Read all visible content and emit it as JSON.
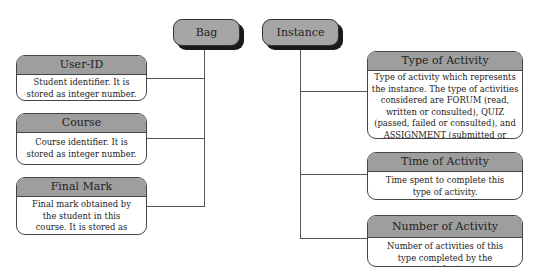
{
  "diagram": {
    "roots": {
      "bag": {
        "label": "Bag",
        "fill": "#a6a6a6"
      },
      "instance": {
        "label": "Instance",
        "fill": "#a6a6a6"
      }
    },
    "bag_attributes": [
      {
        "title": "User-ID",
        "description": "Student identifier. It is stored as integer number."
      },
      {
        "title": "Course",
        "description": "Course identifier. It is stored as integer number."
      },
      {
        "title": "Final Mark",
        "description": "Final mark obtained by the student in this course. It is stored as numerically."
      }
    ],
    "instance_attributes": [
      {
        "title": "Type of Activity",
        "description": "Type of activity which represents the instance. The type of activities considered are FORUM (read, written or consulted), QUIZ (passed, failed or consulted), and ASSIGNMENT (submitted or consulted)."
      },
      {
        "title": "Time of Activity",
        "description": "Time spent to complete this type of activity."
      },
      {
        "title": "Number of Activity",
        "description": "Number of activities of this type completed by the student."
      }
    ],
    "colors": {
      "header_fill": "#9e9e9e",
      "shadow": "#1a1a1a",
      "line": "#555555"
    }
  }
}
